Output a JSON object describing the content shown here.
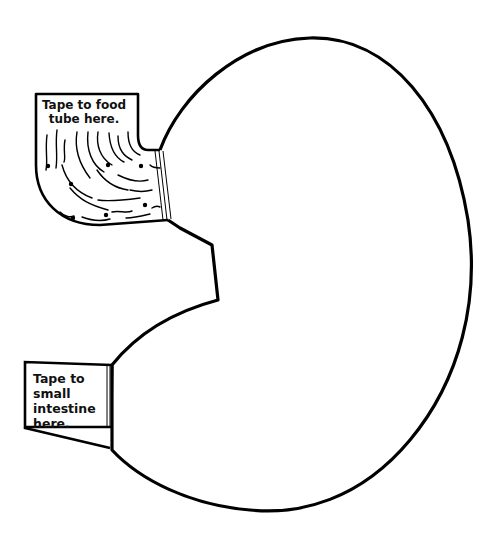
{
  "diagram": {
    "stroke_color": "#000000",
    "background": "#ffffff",
    "labels": {
      "food_tube_tab": "Tape to food tube here.",
      "intestine_tab_lines": [
        "Tape to",
        "small",
        "intestine",
        "here."
      ]
    }
  }
}
